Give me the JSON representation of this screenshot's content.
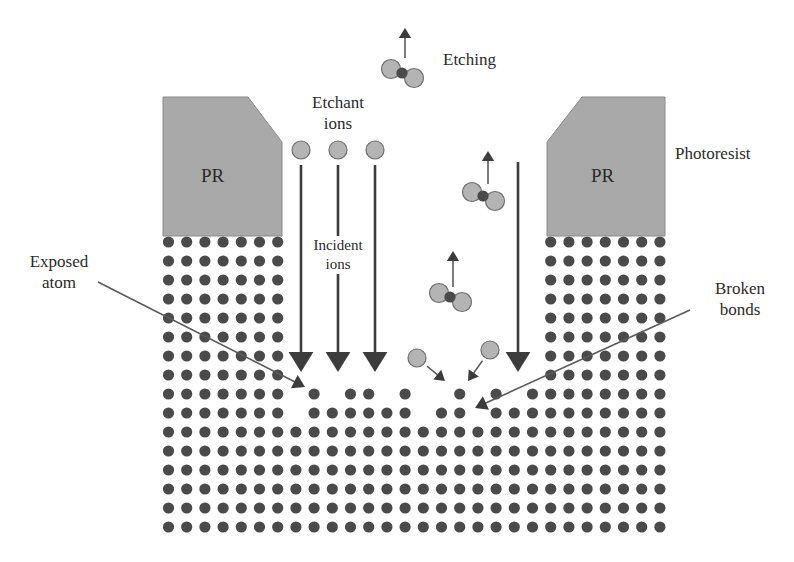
{
  "labels": {
    "etching": "Etching",
    "etchant_line1": "Etchant",
    "etchant_line2": "ions",
    "photoresist": "Photoresist",
    "pr_left": "PR",
    "pr_right": "PR",
    "incident_line1": "Incident",
    "incident_line2": "ions",
    "exposed_line1": "Exposed",
    "exposed_line2": "atom",
    "broken_line1": "Broken",
    "broken_line2": "bonds"
  },
  "colors": {
    "atom": "#4a4a4a",
    "ion": "#b4b4b4",
    "ion_stroke": "#6e6e6e",
    "photoresist": "#a9a9a9",
    "arrow": "#3c3c3c",
    "pointer_line": "#5a5a5a"
  },
  "lattice": {
    "cols": 28,
    "rows": 16,
    "x0": 168.5,
    "dx": 18.2,
    "y0": 242,
    "dy": 19.0,
    "atom_radius": 5.6,
    "missing_atoms_note": "etched pit between photoresist blocks; rows 0-7 only columns 0-6 and 21-27 present",
    "partial_rows": {
      "8": [
        0,
        1,
        2,
        3,
        4,
        5,
        6,
        8,
        10,
        11,
        13,
        16,
        18,
        20,
        21,
        22,
        23,
        24,
        25,
        26,
        27
      ],
      "9": [
        0,
        1,
        2,
        3,
        4,
        5,
        6,
        8,
        9,
        10,
        11,
        12,
        13,
        15,
        16,
        18,
        19,
        20,
        21,
        22,
        23,
        24,
        25,
        26,
        27
      ]
    }
  },
  "photoresist_blocks": [
    {
      "name": "left",
      "points": "163,97 248,97 282,142 282,236 163,236"
    },
    {
      "name": "right",
      "points": "582,97 665,97 665,236 547,236 547,142"
    }
  ],
  "etchant_ions": [
    {
      "x": 301,
      "y": 150
    },
    {
      "x": 338,
      "y": 150
    },
    {
      "x": 375,
      "y": 150
    }
  ],
  "incident_arrows": [
    {
      "x": 301,
      "y1": 165,
      "y2": 372
    },
    {
      "x": 338,
      "y1": 165,
      "y2": 372
    },
    {
      "x": 375,
      "y1": 165,
      "y2": 372
    },
    {
      "x": 518,
      "y1": 162,
      "y2": 372
    }
  ],
  "etched_molecules": [
    {
      "cx": 402,
      "cy": 73,
      "arrow_x": 405,
      "arrow_y1": 58,
      "arrow_y2": 28
    },
    {
      "cx": 483,
      "cy": 196,
      "arrow_x": 488,
      "arrow_y1": 184,
      "arrow_y2": 151
    },
    {
      "cx": 450,
      "cy": 297,
      "arrow_x": 453,
      "arrow_y1": 287,
      "arrow_y2": 251
    }
  ],
  "free_ions": [
    {
      "x": 417,
      "y": 358,
      "arrow_to_x": 445,
      "arrow_to_y": 381
    },
    {
      "x": 490,
      "y": 350,
      "arrow_to_x": 468,
      "arrow_to_y": 381
    }
  ],
  "pointers": [
    {
      "name": "exposed-atom",
      "x1": 98,
      "y1": 282,
      "x2": 305,
      "y2": 387
    },
    {
      "name": "broken-bonds",
      "x1": 690,
      "y1": 310,
      "x2": 475,
      "y2": 408
    }
  ]
}
